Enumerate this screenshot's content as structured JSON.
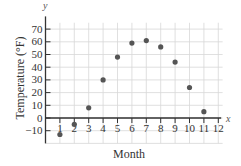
{
  "chart_data": {
    "type": "scatter",
    "title": "",
    "xlabel": "Month",
    "ylabel": "Temperature (°F)",
    "x_axis_var": "x",
    "y_axis_var": "y",
    "x": [
      1,
      2,
      3,
      4,
      5,
      6,
      7,
      8,
      9,
      10,
      11
    ],
    "values": [
      -13,
      -5,
      8,
      30,
      48,
      59,
      61,
      56,
      44,
      24,
      5
    ],
    "x_ticks": [
      "1",
      "2",
      "3",
      "4",
      "5",
      "6",
      "7",
      "8",
      "9",
      "10",
      "11",
      "12"
    ],
    "y_ticks": [
      "-10",
      "0",
      "10",
      "20",
      "30",
      "40",
      "50",
      "60",
      "70"
    ],
    "xlim": [
      0,
      12
    ],
    "ylim": [
      -20,
      80
    ],
    "grid": true,
    "legend": null,
    "colors": {
      "point": "#555555",
      "axis": "#333333",
      "grid": "#d8d8d8"
    }
  }
}
